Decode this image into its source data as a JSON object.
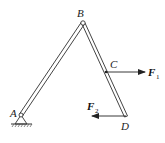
{
  "diagram": {
    "type": "mechanism",
    "points": {
      "A": {
        "label": "A",
        "x": 21,
        "y": 115
      },
      "B": {
        "label": "B",
        "x": 83,
        "y": 23
      },
      "C": {
        "label": "C",
        "x": 107,
        "y": 72
      },
      "D": {
        "label": "D",
        "x": 126,
        "y": 116
      }
    },
    "forces": [
      {
        "name": "F",
        "subscript": "1",
        "at": "C",
        "direction": "right"
      },
      {
        "name": "F",
        "subscript": "2",
        "at": "D",
        "direction": "left"
      }
    ],
    "support": {
      "type": "fixed-pin",
      "at": "A"
    },
    "colors": {
      "line": "#333333",
      "background": "#ffffff"
    }
  }
}
